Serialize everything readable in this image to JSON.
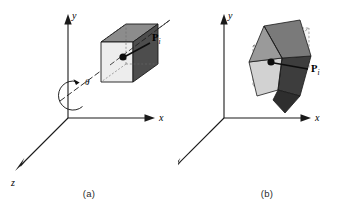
{
  "figure": {
    "panels": [
      {
        "id": "a",
        "caption": "(a)",
        "axes": {
          "y": "y",
          "x": "x",
          "z": "z"
        },
        "angle_label": "θ",
        "point_label": "P",
        "point_subscript": "i",
        "description": "cube before rotation about an arbitrary axis"
      },
      {
        "id": "b",
        "caption": "(b)",
        "axes": {
          "y": "y",
          "x": "x",
          "z": "z"
        },
        "angle_label": "",
        "point_label": "P",
        "point_subscript": "i",
        "description": "cube after rotation about the arbitrary axis"
      }
    ],
    "colors": {
      "stroke": "#1a1a1a",
      "cube_top": "#8c8c8c",
      "cube_front": "#ededed",
      "cube_right": "#4d4d4d",
      "cube_rot_top": "#7a7a7a",
      "cube_rot_face": "#c9c9c9",
      "cube_rot_dark": "#3d3d3d",
      "ghost_fill": "#f2f2f2",
      "dash": "#555555",
      "background": "#ffffff"
    }
  }
}
